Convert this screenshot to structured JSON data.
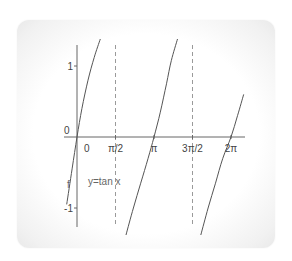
{
  "chart_data": {
    "type": "line",
    "title": "",
    "function": "y = tan x",
    "annotation": "y=tan x",
    "ylabel": "f",
    "xlabel": "",
    "origin_label": "0",
    "x_ticks": [
      {
        "value": 0,
        "label": "0"
      },
      {
        "value": 1.5708,
        "label": "π/2"
      },
      {
        "value": 3.1416,
        "label": "π"
      },
      {
        "value": 4.7124,
        "label": "3π/2"
      },
      {
        "value": 6.2832,
        "label": "2π"
      }
    ],
    "y_ticks": [
      {
        "value": 1,
        "label": "1"
      },
      {
        "value": -1,
        "label": "-1"
      }
    ],
    "asymptotes": [
      1.5708,
      4.7124
    ],
    "xlim": [
      -0.5,
      6.9
    ],
    "ylim": [
      -1.4,
      1.4
    ],
    "grid": false,
    "series": [
      {
        "name": "branch-1",
        "x": [
          -0.42,
          -0.2,
          0,
          0.2,
          0.45,
          0.7,
          0.95
        ],
        "y": [
          -0.95,
          -0.45,
          0,
          0.4,
          0.8,
          1.12,
          1.38
        ]
      },
      {
        "name": "branch-2",
        "x": [
          2.0,
          2.3,
          2.6,
          2.9,
          3.1416,
          3.4,
          3.65,
          3.85,
          4.1
        ],
        "y": [
          -1.38,
          -1.0,
          -0.65,
          -0.3,
          0,
          0.35,
          0.75,
          1.08,
          1.38
        ]
      },
      {
        "name": "branch-3",
        "x": [
          5.05,
          5.35,
          5.65,
          5.95,
          6.2832,
          6.55,
          6.8
        ],
        "y": [
          -1.38,
          -1.0,
          -0.65,
          -0.3,
          0,
          0.3,
          0.6
        ]
      }
    ]
  }
}
